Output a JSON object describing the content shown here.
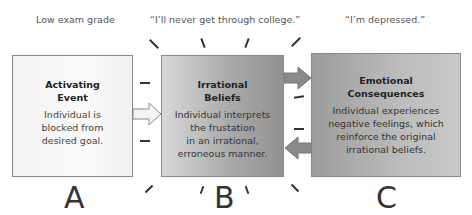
{
  "diagram": {
    "captions": {
      "a": "Low exam grade",
      "b": "“I’ll never get through college.”",
      "c": "“I’m depressed.”"
    },
    "boxes": {
      "a": {
        "title_line1": "Activating",
        "title_line2": "Event",
        "desc_lines": [
          "Individual is",
          "blocked from",
          "desired goal."
        ],
        "letter": "A"
      },
      "b": {
        "title_line1": "Irrational",
        "title_line2": "Beliefs",
        "desc_lines": [
          "Individual interprets",
          "the frustation",
          "in an irrational,",
          "erroneous manner."
        ],
        "letter": "B"
      },
      "c": {
        "title_line1": "Emotional",
        "title_line2": "Consequences",
        "desc_lines": [
          "Individual experiences",
          "negative feelings, which",
          "reinforce the original",
          "irrational beliefs."
        ],
        "letter": "C"
      }
    },
    "arrows": [
      {
        "from": "A",
        "to": "B",
        "style": "hollow"
      },
      {
        "from": "B",
        "to": "C",
        "style": "filled"
      },
      {
        "from": "C",
        "to": "B",
        "style": "filled"
      }
    ],
    "colors": {
      "box_a": "#f5f5f5",
      "box_b": "#a7a7a7",
      "box_c": "#b5b5b5",
      "arrow_fill": "#8a8a8a",
      "border": "#888888"
    }
  }
}
